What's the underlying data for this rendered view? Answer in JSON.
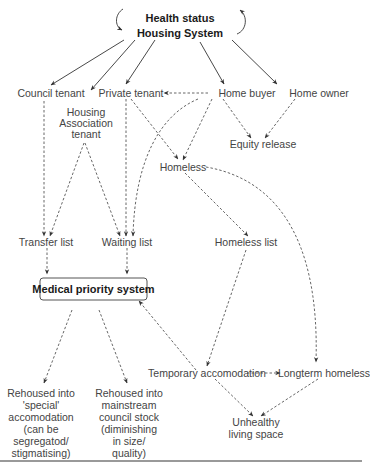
{
  "diagram": {
    "header": {
      "line1": "Health status",
      "line2": "Housing System"
    },
    "nodes": {
      "council_tenant": "Council tenant",
      "private_tenant": "Private tenant",
      "home_buyer": "Home buyer",
      "home_owner": "Home owner",
      "housing_assoc_1": "Housing",
      "housing_assoc_2": "Association",
      "housing_assoc_3": "tenant",
      "equity_release": "Equity release",
      "homeless": "Homeless",
      "homeless_list": "Homeless list",
      "transfer_list": "Transfer list",
      "waiting_list": "Waiting list",
      "medical_priority": "Medical priority system",
      "temporary_accom": "Temporary accomodation",
      "longterm_homeless": "Longterm homeless",
      "unhealthy_1": "Unhealthy",
      "unhealthy_2": "living space",
      "special_1": "Rehoused into",
      "special_2": "'special'",
      "special_3": "accomodation",
      "special_4": "(can be",
      "special_5": "segregatod/",
      "special_6": "stigmatising)",
      "mainstream_1": "Rehoused into",
      "mainstream_2": "mainstream",
      "mainstream_3": "council stock",
      "mainstream_4": "(diminishing",
      "mainstream_5": "in size/",
      "mainstream_6": "quality)"
    },
    "edges": [
      {
        "from": "Housing System",
        "to": "Council tenant",
        "style": "solid"
      },
      {
        "from": "Housing System",
        "to": "Housing Association tenant",
        "style": "solid"
      },
      {
        "from": "Housing System",
        "to": "Private tenant",
        "style": "solid"
      },
      {
        "from": "Housing System",
        "to": "Home buyer",
        "style": "solid"
      },
      {
        "from": "Housing System",
        "to": "Home owner",
        "style": "solid"
      },
      {
        "from": "Home buyer",
        "to": "Private tenant",
        "style": "dashed"
      },
      {
        "from": "Home buyer",
        "to": "Equity release",
        "style": "dashed"
      },
      {
        "from": "Home owner",
        "to": "Equity release",
        "style": "dashed"
      },
      {
        "from": "Home buyer",
        "to": "Homeless",
        "style": "dashed"
      },
      {
        "from": "Private tenant",
        "to": "Homeless",
        "style": "dashed"
      },
      {
        "from": "Home buyer",
        "to": "Waiting list",
        "style": "dashed"
      },
      {
        "from": "Private tenant",
        "to": "Waiting list",
        "style": "dashed"
      },
      {
        "from": "Council tenant",
        "to": "Transfer list",
        "style": "dashed"
      },
      {
        "from": "Housing Association tenant",
        "to": "Transfer list",
        "style": "dashed"
      },
      {
        "from": "Housing Association tenant",
        "to": "Waiting list",
        "style": "dashed"
      },
      {
        "from": "Homeless",
        "to": "Homeless list",
        "style": "dashed"
      },
      {
        "from": "Homeless",
        "to": "Longterm homeless",
        "style": "dashed"
      },
      {
        "from": "Transfer list",
        "to": "Medical priority system",
        "style": "dashed"
      },
      {
        "from": "Waiting list",
        "to": "Medical priority system",
        "style": "dashed"
      },
      {
        "from": "Homeless list",
        "to": "Temporary accomodation",
        "style": "dashed"
      },
      {
        "from": "Temporary accomodation",
        "to": "Medical priority system",
        "style": "dashed"
      },
      {
        "from": "Temporary accomodation",
        "to": "Longterm homeless",
        "style": "dashed"
      },
      {
        "from": "Temporary accomodation",
        "to": "Unhealthy living space",
        "style": "dashed"
      },
      {
        "from": "Longterm homeless",
        "to": "Unhealthy living space",
        "style": "dashed"
      },
      {
        "from": "Medical priority system",
        "to": "Rehoused into 'special' accomodation",
        "style": "dashed"
      },
      {
        "from": "Medical priority system",
        "to": "Rehoused into mainstream council stock",
        "style": "dashed"
      }
    ]
  }
}
